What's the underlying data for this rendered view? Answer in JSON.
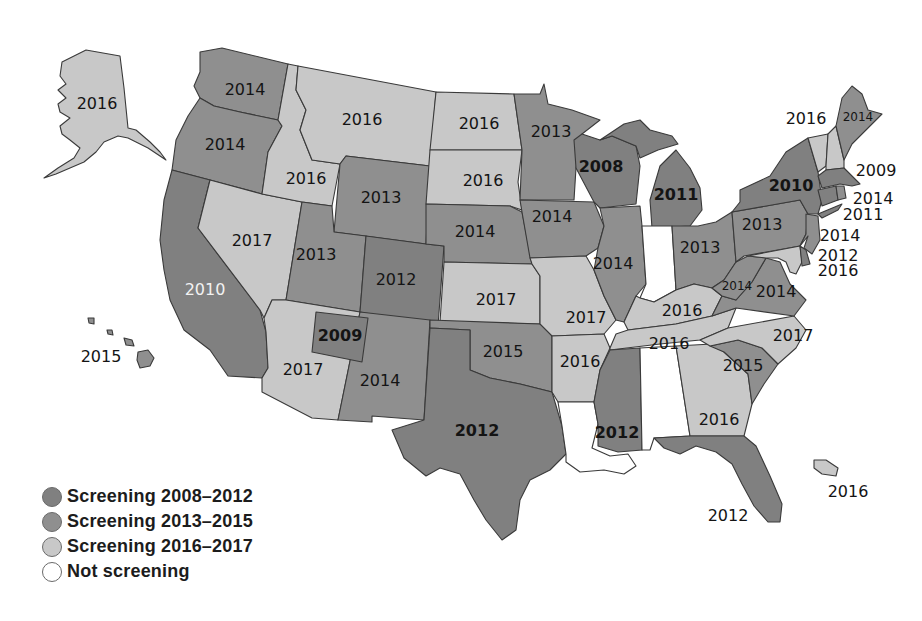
{
  "colors": {
    "c2008_2012": "#808080",
    "c2013_2015": "#8f8f8f",
    "c2016_2017": "#c8c8c8",
    "none": "#ffffff"
  },
  "legend": [
    {
      "label": "Screening 2008–2012",
      "color": "#808080"
    },
    {
      "label": "Screening 2013–2015",
      "color": "#8f8f8f"
    },
    {
      "label": "Screening 2016–2017",
      "color": "#c8c8c8"
    },
    {
      "label": "Not screening",
      "color": "#ffffff"
    }
  ],
  "states": {
    "AK": {
      "name": "Alaska",
      "year": "2016",
      "group": "c2016_2017"
    },
    "HI": {
      "name": "Hawaii",
      "year": "2015",
      "group": "c2013_2015"
    },
    "PR": {
      "name": "Puerto Rico",
      "year": "2016",
      "group": "c2016_2017"
    },
    "WA": {
      "name": "Washington",
      "year": "2014",
      "group": "c2013_2015"
    },
    "OR": {
      "name": "Oregon",
      "year": "2014",
      "group": "c2013_2015"
    },
    "CA": {
      "name": "California",
      "year": "2010",
      "group": "c2008_2012"
    },
    "NV": {
      "name": "Nevada",
      "year": "2017",
      "group": "c2016_2017"
    },
    "ID": {
      "name": "Idaho",
      "year": "2016",
      "group": "c2016_2017"
    },
    "MT": {
      "name": "Montana",
      "year": "2016",
      "group": "c2016_2017"
    },
    "WY": {
      "name": "Wyoming",
      "year": "2013",
      "group": "c2013_2015"
    },
    "UT": {
      "name": "Utah",
      "year": "2013",
      "group": "c2013_2015"
    },
    "AZ": {
      "name": "Arizona",
      "year": "2017",
      "group": "c2016_2017"
    },
    "NAVAJO": {
      "name": "Navajo Nation",
      "year": "2009",
      "group": "c2008_2012"
    },
    "CO": {
      "name": "Colorado",
      "year": "2012",
      "group": "c2008_2012"
    },
    "NM": {
      "name": "New Mexico",
      "year": "2014",
      "group": "c2013_2015"
    },
    "ND": {
      "name": "North Dakota",
      "year": "2016",
      "group": "c2016_2017"
    },
    "SD": {
      "name": "South Dakota",
      "year": "2016",
      "group": "c2016_2017"
    },
    "NE": {
      "name": "Nebraska",
      "year": "2014",
      "group": "c2013_2015"
    },
    "KS": {
      "name": "Kansas",
      "year": "2017",
      "group": "c2016_2017"
    },
    "OK": {
      "name": "Oklahoma",
      "year": "2015",
      "group": "c2013_2015"
    },
    "TX": {
      "name": "Texas",
      "year": "2012",
      "group": "c2008_2012"
    },
    "MN": {
      "name": "Minnesota",
      "year": "2013",
      "group": "c2013_2015"
    },
    "IA": {
      "name": "Iowa",
      "year": "2014",
      "group": "c2013_2015"
    },
    "MO": {
      "name": "Missouri",
      "year": "2017",
      "group": "c2016_2017"
    },
    "AR": {
      "name": "Arkansas",
      "year": "2016",
      "group": "c2016_2017"
    },
    "LA": {
      "name": "Louisiana",
      "year": "",
      "group": "none"
    },
    "WI": {
      "name": "Wisconsin",
      "year": "2008",
      "group": "c2008_2012"
    },
    "IL": {
      "name": "Illinois",
      "year": "2014",
      "group": "c2013_2015"
    },
    "MI": {
      "name": "Michigan",
      "year": "2011",
      "group": "c2008_2012"
    },
    "IN": {
      "name": "Indiana",
      "year": "",
      "group": "none"
    },
    "OH": {
      "name": "Ohio",
      "year": "2013",
      "group": "c2013_2015"
    },
    "KY": {
      "name": "Kentucky",
      "year": "2016",
      "group": "c2016_2017"
    },
    "TN": {
      "name": "Tennessee",
      "year": "2016",
      "group": "c2016_2017"
    },
    "MS": {
      "name": "Mississippi",
      "year": "2012",
      "group": "c2008_2012"
    },
    "AL": {
      "name": "Alabama",
      "year": "",
      "group": "none"
    },
    "GA": {
      "name": "Georgia",
      "year": "2016",
      "group": "c2016_2017"
    },
    "FL": {
      "name": "Florida",
      "year": "2012",
      "group": "c2008_2012"
    },
    "SC": {
      "name": "South Carolina",
      "year": "2015",
      "group": "c2013_2015"
    },
    "NC": {
      "name": "North Carolina",
      "year": "2017",
      "group": "c2016_2017"
    },
    "VA": {
      "name": "Virginia",
      "year": "2014",
      "group": "c2013_2015"
    },
    "WV": {
      "name": "West Virginia",
      "year": "2014",
      "group": "c2013_2015"
    },
    "PA": {
      "name": "Pennsylvania",
      "year": "2013",
      "group": "c2013_2015"
    },
    "NY": {
      "name": "New York",
      "year": "2010",
      "group": "c2008_2012"
    },
    "VT": {
      "name": "Vermont",
      "year": "2016",
      "group": "c2016_2017"
    },
    "NH": {
      "name": "New Hampshire",
      "year": "",
      "group": "c2016_2017"
    },
    "ME": {
      "name": "Maine",
      "year": "2014",
      "group": "c2013_2015"
    },
    "MA": {
      "name": "Massachusetts",
      "year": "2009",
      "group": "c2008_2012"
    },
    "RI": {
      "name": "Rhode Island",
      "year": "2014",
      "group": "c2013_2015"
    },
    "CT": {
      "name": "Connecticut",
      "year": "2011",
      "group": "c2008_2012"
    },
    "NJ": {
      "name": "New Jersey",
      "year": "2014",
      "group": "c2013_2015"
    },
    "DE": {
      "name": "Delaware",
      "year": "2012",
      "group": "c2008_2012"
    },
    "MD": {
      "name": "Maryland",
      "year": "2016",
      "group": "c2016_2017"
    }
  },
  "labels": {
    "AK": "2016",
    "HI": "2015",
    "PR": "2016",
    "WA": "2014",
    "OR": "2014",
    "CA": "2010",
    "NV": "2017",
    "ID": "2016",
    "MT": "2016",
    "WY": "2013",
    "UT": "2013",
    "AZ": "2017",
    "NAVAJO": "2009",
    "CO": "2012",
    "NM": "2014",
    "ND": "2016",
    "SD": "2016",
    "NE": "2014",
    "KS": "2017",
    "OK": "2015",
    "TX": "2012",
    "MN": "2013",
    "IA": "2014",
    "MO": "2017",
    "AR": "2016",
    "WI": "2008",
    "IL": "2014",
    "MI": "2011",
    "OH": "2013",
    "KY": "2016",
    "TN": "2016",
    "MS": "2012",
    "GA": "2016",
    "FL": "2012",
    "SC": "2015",
    "NC": "2017",
    "VA": "2014",
    "WV": "2014",
    "PA": "2013",
    "NY": "2010",
    "VT": "2016",
    "ME": "2014",
    "MA": "2009",
    "RI": "2014",
    "CT": "2011",
    "NJ": "2014",
    "DE": "2012",
    "MD": "2016"
  }
}
